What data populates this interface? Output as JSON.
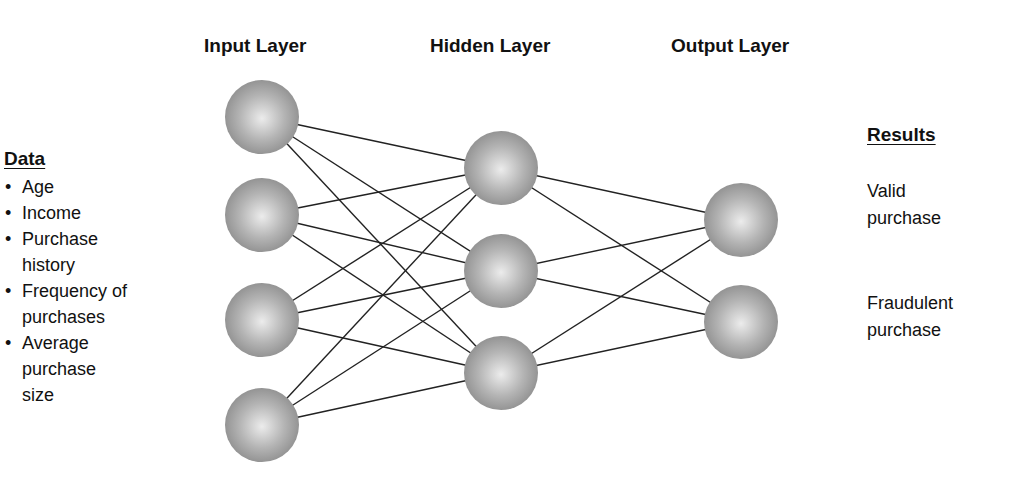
{
  "layers": {
    "input": {
      "title": "Input Layer",
      "nodes": [
        [
          262,
          117
        ],
        [
          262,
          215
        ],
        [
          262,
          320
        ],
        [
          262,
          425
        ]
      ]
    },
    "hidden": {
      "title": "Hidden Layer",
      "nodes": [
        [
          501,
          168
        ],
        [
          501,
          271
        ],
        [
          501,
          373
        ]
      ]
    },
    "output": {
      "title": "Output Layer",
      "nodes": [
        [
          741,
          220
        ],
        [
          741,
          322
        ]
      ]
    }
  },
  "node_radius": 37,
  "colors": {
    "node_light": "#e9e9e9",
    "node_mid": "#b0b0b0",
    "node_dark": "#8a8a8a",
    "edge": "#222222",
    "text": "#111111"
  },
  "data_panel": {
    "title": "Data",
    "bullet": "•",
    "items": [
      {
        "label": "Age"
      },
      {
        "label": "Income"
      },
      {
        "label": "Purchase history"
      },
      {
        "label": "Frequency of purchases"
      },
      {
        "label": "Average purchase size"
      }
    ]
  },
  "results_panel": {
    "title": "Results",
    "items": [
      {
        "label": "Valid purchase"
      },
      {
        "label": "Fraudulent purchase"
      }
    ]
  }
}
